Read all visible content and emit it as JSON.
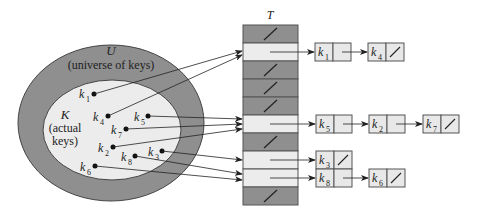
{
  "diagram": {
    "type": "hash-table-chaining",
    "universe": {
      "symbol": "U",
      "caption": "(universe of keys)"
    },
    "actual_keys": {
      "symbol": "K",
      "caption_line1": "(actual",
      "caption_line2": "keys)"
    },
    "table_label": "T",
    "colors": {
      "outer_ellipse": "#8f8f8f",
      "inner_ellipse": "#ececec",
      "empty_slot": "#8f8f8f",
      "used_slot": "#ececec",
      "node_fill": "#e8e8e8",
      "stroke": "#333333"
    },
    "keys": [
      {
        "name": "k",
        "sub": "1",
        "slot": 1
      },
      {
        "name": "k",
        "sub": "4",
        "slot": 1
      },
      {
        "name": "k",
        "sub": "5",
        "slot": 5
      },
      {
        "name": "k",
        "sub": "7",
        "slot": 5
      },
      {
        "name": "k",
        "sub": "2",
        "slot": 5
      },
      {
        "name": "k",
        "sub": "3",
        "slot": 7
      },
      {
        "name": "k",
        "sub": "8",
        "slot": 8
      },
      {
        "name": "k",
        "sub": "6",
        "slot": 8
      }
    ],
    "slots": [
      {
        "index": 0,
        "empty": true,
        "chain": []
      },
      {
        "index": 1,
        "empty": false,
        "chain": [
          "k1",
          "k4"
        ]
      },
      {
        "index": 2,
        "empty": true,
        "chain": []
      },
      {
        "index": 3,
        "empty": true,
        "chain": []
      },
      {
        "index": 4,
        "empty": true,
        "chain": []
      },
      {
        "index": 5,
        "empty": false,
        "chain": [
          "k5",
          "k2",
          "k7"
        ]
      },
      {
        "index": 6,
        "empty": true,
        "chain": []
      },
      {
        "index": 7,
        "empty": false,
        "chain": [
          "k3"
        ]
      },
      {
        "index": 8,
        "empty": false,
        "chain": [
          "k8",
          "k6"
        ]
      },
      {
        "index": 9,
        "empty": true,
        "chain": []
      }
    ],
    "labels": {
      "k1": {
        "main": "k",
        "sub": "1"
      },
      "k2": {
        "main": "k",
        "sub": "2"
      },
      "k3": {
        "main": "k",
        "sub": "3"
      },
      "k4": {
        "main": "k",
        "sub": "4"
      },
      "k5": {
        "main": "k",
        "sub": "5"
      },
      "k6": {
        "main": "k",
        "sub": "6"
      },
      "k7": {
        "main": "k",
        "sub": "7"
      },
      "k8": {
        "main": "k",
        "sub": "8"
      }
    }
  }
}
